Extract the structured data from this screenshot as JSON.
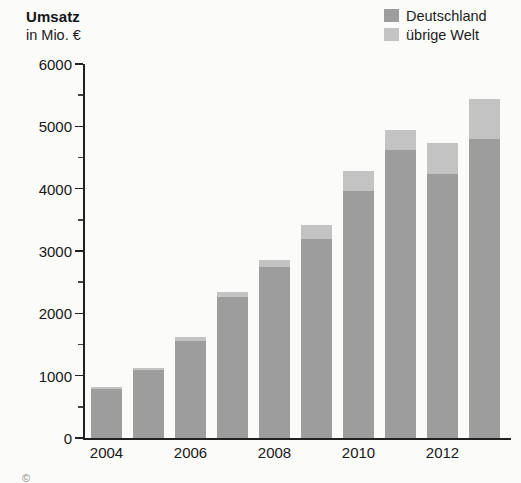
{
  "chart_data": {
    "type": "bar",
    "title": "Umsatz",
    "subtitle": "in Mio. €",
    "xlabel": "",
    "ylabel": "in Mio. €",
    "ylim": [
      0,
      6000
    ],
    "ytick_step": 1000,
    "yminor_step": 500,
    "grid": false,
    "stacked": true,
    "legend_position": "top-right",
    "categories": [
      "2004",
      "2005",
      "2006",
      "2007",
      "2008",
      "2009",
      "2010",
      "2011",
      "2012",
      "2013"
    ],
    "tick_labels_shown": [
      "2004",
      "2006",
      "2008",
      "2010",
      "2012"
    ],
    "ytick_labels": [
      "6000",
      "5000",
      "4000",
      "3000",
      "2000",
      "1000",
      "0"
    ],
    "ytick_values": [
      6000,
      5000,
      4000,
      3000,
      2000,
      1000,
      0
    ],
    "series": [
      {
        "name": "Deutschland",
        "color": "#9d9d9d",
        "values": [
          790,
          1090,
          1560,
          2260,
          2740,
          3190,
          3960,
          4620,
          4230,
          4800
        ]
      },
      {
        "name": "übrige Welt",
        "color": "#c3c3c3",
        "values": [
          30,
          30,
          60,
          80,
          120,
          220,
          320,
          320,
          510,
          640
        ]
      }
    ],
    "totals": [
      820,
      1120,
      1620,
      2340,
      2860,
      3410,
      4280,
      4940,
      4740,
      5440
    ]
  },
  "legend": {
    "items": [
      {
        "label": "Deutschland",
        "color": "#9d9d9d"
      },
      {
        "label": "übrige Welt",
        "color": "#c3c3c3"
      }
    ]
  },
  "colors": {
    "germany": "#9d9d9d",
    "world": "#c3c3c3",
    "axis": "#222222",
    "text": "#181818",
    "background": "#fbfbfa"
  },
  "marks": {
    "bottom_symbol": "©"
  }
}
